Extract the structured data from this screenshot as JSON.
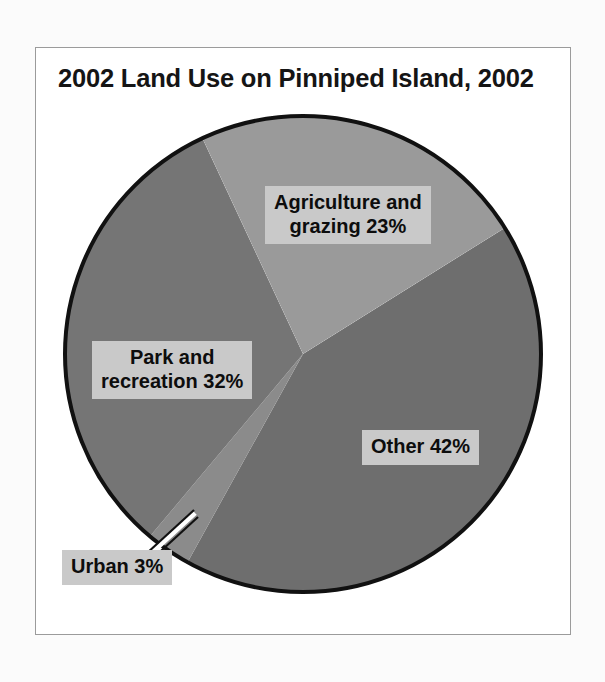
{
  "figure": {
    "title": "2002 Land Use on Pinniped Island, 2002",
    "background_color": "#ffffff",
    "frame_color": "#9b9b9b",
    "label_background_color": "#c9c9c9",
    "label_text_color": "#0d0d0d",
    "outline_color": "#111111",
    "leader_line_color": "#ffffff"
  },
  "chart_data": {
    "type": "pie",
    "title": "2002 Land Use on Pinniped Island, 2002",
    "xlabel": "",
    "ylabel": "",
    "unit": "percent",
    "total": 100,
    "legend": "none",
    "grid": false,
    "labels_on_slices": true,
    "categories": [
      "Other",
      "Park and recreation",
      "Agriculture and grazing",
      "Urban"
    ],
    "values": [
      42,
      32,
      23,
      3
    ],
    "slices": [
      {
        "name": "Other",
        "label": "Other 42%",
        "value": 42,
        "color": "#6e6e6e",
        "start_angle_deg": 58,
        "end_angle_deg": 209
      },
      {
        "name": "Park and recreation",
        "label_line_1": "Park and",
        "label_line_2": "recreation 32%",
        "label": "Park and recreation 32%",
        "value": 32,
        "color": "#757575",
        "start_angle_deg": 220,
        "end_angle_deg": 335
      },
      {
        "name": "Agriculture and grazing",
        "label_line_1": "Agriculture and",
        "label_line_2": "grazing 23%",
        "label": "Agriculture and grazing 23%",
        "value": 23,
        "color": "#9a9a9a",
        "start_angle_deg": 335,
        "end_angle_deg": 58
      },
      {
        "name": "Urban",
        "label": "Urban 3%",
        "value": 3,
        "color": "#8b8b8b",
        "start_angle_deg": 209,
        "end_angle_deg": 220
      }
    ]
  }
}
